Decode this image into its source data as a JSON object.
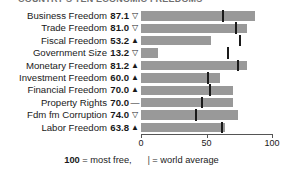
{
  "title": "COUNTRY'S TEN ECONOMIC FREEDOMS",
  "axis": {
    "ticks": [
      {
        "value": 0,
        "label": "0"
      },
      {
        "value": 50,
        "label": "50"
      },
      {
        "value": 100,
        "label": "100"
      }
    ],
    "min": 0,
    "max": 100
  },
  "legend": {
    "score_lead": "100",
    "score_text": " = most free,",
    "marker_glyph": "|",
    "marker_text": " = world average"
  },
  "colors": {
    "bar": "#999999",
    "world_average_marker": "#1a1a1a",
    "text": "#1a1a1a",
    "axis": "#555555"
  },
  "chart_data": {
    "type": "bar",
    "title": "COUNTRY'S TEN ECONOMIC FREEDOMS",
    "xlabel": "",
    "ylabel": "",
    "xlim": [
      0,
      100
    ],
    "grid": false,
    "legend_position": "bottom",
    "orientation": "horizontal",
    "categories": [
      "Business Freedom",
      "Trade Freedom",
      "Fiscal Freedom",
      "Government Size",
      "Monetary Freedom",
      "Investment Freedom",
      "Financial Freedom",
      "Property Rights",
      "Fdm fm Corruption",
      "Labor Freedom"
    ],
    "values": [
      87.1,
      81.0,
      53.2,
      13.2,
      81.2,
      60.0,
      70.0,
      70.0,
      74.0,
      63.8
    ],
    "value_labels": [
      "87.1",
      "81.0",
      "53.2",
      "13.2",
      "81.2",
      "60.0",
      "70.0",
      "70.0",
      "74.0",
      "63.8"
    ],
    "trend": [
      "down",
      "down",
      "up",
      "down",
      "up",
      "up",
      "up",
      "flat",
      "down",
      "up"
    ],
    "trend_glyphs": [
      "▽",
      "▽",
      "▲",
      "▽",
      "▲",
      "▲",
      "▲",
      "—",
      "▽",
      "▲"
    ],
    "world_average": [
      62,
      72,
      75,
      66,
      73,
      50,
      52,
      46,
      41,
      61
    ],
    "series": [
      {
        "name": "Country score",
        "values": [
          87.1,
          81.0,
          53.2,
          13.2,
          81.2,
          60.0,
          70.0,
          70.0,
          74.0,
          63.8
        ]
      },
      {
        "name": "World average",
        "values": [
          62,
          72,
          75,
          66,
          73,
          50,
          52,
          46,
          41,
          61
        ]
      }
    ]
  },
  "rows": [
    {
      "label": "Business Freedom",
      "score": "87.1",
      "value": 87.1,
      "trend": "down",
      "avg": 62
    },
    {
      "label": "Trade Freedom",
      "score": "81.0",
      "value": 81.0,
      "trend": "down",
      "avg": 72
    },
    {
      "label": "Fiscal Freedom",
      "score": "53.2",
      "value": 53.2,
      "trend": "up",
      "avg": 75
    },
    {
      "label": "Government Size",
      "score": "13.2",
      "value": 13.2,
      "trend": "down",
      "avg": 66
    },
    {
      "label": "Monetary Freedom",
      "score": "81.2",
      "value": 81.2,
      "trend": "up",
      "avg": 73
    },
    {
      "label": "Investment Freedom",
      "score": "60.0",
      "value": 60.0,
      "trend": "up",
      "avg": 50
    },
    {
      "label": "Financial Freedom",
      "score": "70.0",
      "value": 70.0,
      "trend": "up",
      "avg": 52
    },
    {
      "label": "Property Rights",
      "score": "70.0",
      "value": 70.0,
      "trend": "flat",
      "avg": 46
    },
    {
      "label": "Fdm fm Corruption",
      "score": "74.0",
      "value": 74.0,
      "trend": "down",
      "avg": 41
    },
    {
      "label": "Labor Freedom",
      "score": "63.8",
      "value": 63.8,
      "trend": "up",
      "avg": 61
    }
  ]
}
